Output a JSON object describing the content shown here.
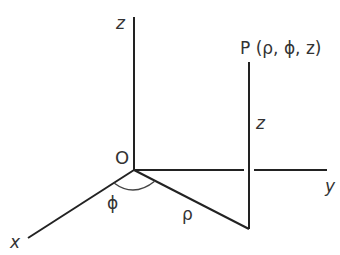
{
  "diagram": {
    "type": "cylindrical-coordinates",
    "labels": {
      "z_axis": "z",
      "y_axis": "y",
      "x_axis": "x",
      "origin": "O",
      "point": "P (ρ, ϕ, z)",
      "height": "z",
      "radius": "ρ",
      "angle": "ϕ"
    },
    "colors": {
      "line": "#222222",
      "text": "#333333",
      "background": "#ffffff"
    }
  }
}
